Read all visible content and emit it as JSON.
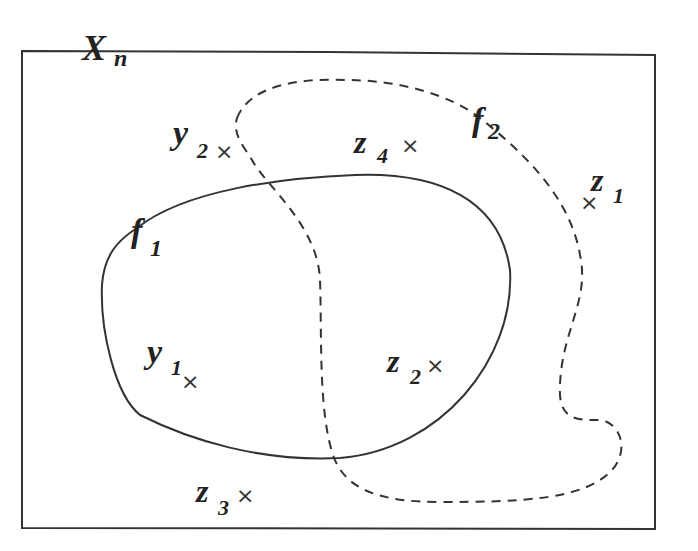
{
  "diagram": {
    "type": "set-diagram",
    "space_label": {
      "main": "X",
      "sub": "n"
    },
    "sets": [
      {
        "name": "f",
        "sub": "1",
        "style": "solid"
      },
      {
        "name": "f",
        "sub": "2",
        "style": "dashed"
      }
    ],
    "points": [
      {
        "name": "y",
        "sub": "1",
        "mark": "×"
      },
      {
        "name": "y",
        "sub": "2",
        "mark": "×"
      },
      {
        "name": "z",
        "sub": "1",
        "mark": "×"
      },
      {
        "name": "z",
        "sub": "2",
        "mark": "×"
      },
      {
        "name": "z",
        "sub": "3",
        "mark": "×"
      },
      {
        "name": "z",
        "sub": "4",
        "mark": "×"
      }
    ],
    "colors": {
      "stroke": "#333333",
      "background": "#ffffff"
    }
  }
}
